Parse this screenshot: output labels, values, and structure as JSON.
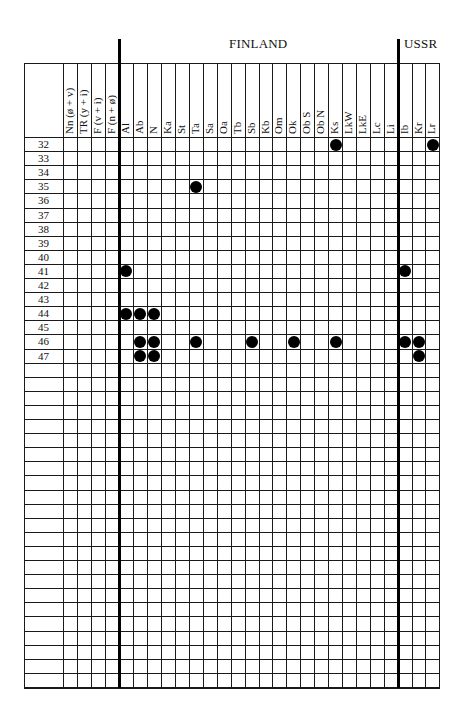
{
  "regions": {
    "finland": "FINLAND",
    "ussr": "USSR"
  },
  "left_columns": [
    "Nn (ø + v)",
    "TR (y + i)",
    "F (v + i)",
    "F (n + ø)"
  ],
  "finland_columns": [
    "Al",
    "Ab",
    "N",
    "Ka",
    "St",
    "Ta",
    "Sa",
    "Oa",
    "Tb",
    "Sb",
    "Kb",
    "Om",
    "Ok",
    "Ob S",
    "Ob N",
    "Ks",
    "LkW",
    "LkE",
    "Lc",
    "Li"
  ],
  "ussr_columns": [
    "Ib",
    "Kr",
    "Lr"
  ],
  "row_labels": [
    "32",
    "33",
    "34",
    "35",
    "36",
    "37",
    "38",
    "39",
    "40",
    "41",
    "42",
    "43",
    "44",
    "45",
    "46",
    "47"
  ],
  "total_rows": 39,
  "dots": [
    {
      "row": "32",
      "col": "Ks"
    },
    {
      "row": "32",
      "col": "Lr"
    },
    {
      "row": "35",
      "col": "Ta"
    },
    {
      "row": "41",
      "col": "Al"
    },
    {
      "row": "41",
      "col": "Ib"
    },
    {
      "row": "44",
      "col": "Al"
    },
    {
      "row": "44",
      "col": "Ab"
    },
    {
      "row": "44",
      "col": "N"
    },
    {
      "row": "46",
      "col": "Ab"
    },
    {
      "row": "46",
      "col": "N"
    },
    {
      "row": "46",
      "col": "Ta"
    },
    {
      "row": "46",
      "col": "Sb"
    },
    {
      "row": "46",
      "col": "Ok"
    },
    {
      "row": "46",
      "col": "Ks"
    },
    {
      "row": "46",
      "col": "Ib"
    },
    {
      "row": "46",
      "col": "Kr"
    },
    {
      "row": "47",
      "col": "Ab"
    },
    {
      "row": "47",
      "col": "N"
    },
    {
      "row": "47",
      "col": "Kr"
    }
  ]
}
